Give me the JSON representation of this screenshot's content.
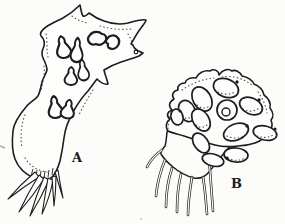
{
  "figure": {
    "specimen_a_label": "A",
    "specimen_b_label": "B"
  },
  "icons": {
    "specimen_a": "lobed-sac-with-spores-and-root-spines-illustration",
    "specimen_b": "cluster-of-oval-sporangia-with-filaments-illustration"
  },
  "colors": {
    "ink": "#1d1d1d",
    "paper": "#fcfcfa"
  }
}
